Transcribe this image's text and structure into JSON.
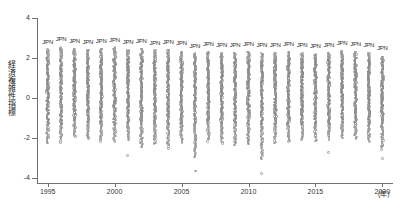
{
  "chart_data": {
    "type": "scatter",
    "title": "",
    "xlabel": "年",
    "ylabel": "経済複雑性指標",
    "xlim": [
      1994.2,
      2020.8
    ],
    "ylim": [
      -4.6,
      4.4
    ],
    "grid": false,
    "legend": null,
    "x_ticks": [
      1995,
      2000,
      2005,
      2010,
      2015,
      2020
    ],
    "x_tick_labels": [
      "1995",
      "2000",
      "2005",
      "2010",
      "2015",
      "2020"
    ],
    "y_ticks": [
      4,
      2,
      0,
      -2,
      -4
    ],
    "y_tick_labels": [
      "4",
      "2",
      "0",
      "-2",
      "-4"
    ],
    "x_unit_label": "(年)",
    "marker": "open-circle",
    "marker_color": "#9a9a9a",
    "annotation_label": "JPN",
    "series": [
      {
        "name": "経済複雑性指標 (全国)",
        "x": [
          1995,
          1996,
          1997,
          1998,
          1999,
          2000,
          2001,
          2002,
          2003,
          2004,
          2005,
          2006,
          2007,
          2008,
          2009,
          2010,
          2011,
          2012,
          2013,
          2014,
          2015,
          2016,
          2017,
          2018,
          2019,
          2020
        ],
        "jpn_values": [
          2.42,
          2.55,
          2.45,
          2.41,
          2.47,
          2.52,
          2.38,
          2.46,
          2.37,
          2.42,
          2.33,
          2.22,
          2.3,
          2.26,
          2.25,
          2.31,
          2.27,
          2.23,
          2.29,
          2.24,
          2.2,
          2.26,
          2.35,
          2.31,
          2.24,
          2.08
        ],
        "year_min": [
          -2.25,
          -2.2,
          -1.95,
          -2.05,
          -2.15,
          -2.2,
          -2.1,
          -2.45,
          -2.3,
          -2.5,
          -2.2,
          -2.95,
          -2.15,
          -2.25,
          -2.35,
          -2.3,
          -3.05,
          -2.25,
          -2.2,
          -2.1,
          -2.15,
          -2.05,
          -2.0,
          -2.05,
          -2.2,
          -2.55
        ],
        "year_max": [
          2.42,
          2.55,
          2.45,
          2.41,
          2.47,
          2.52,
          2.38,
          2.46,
          2.37,
          2.42,
          2.33,
          2.22,
          2.3,
          2.26,
          2.25,
          2.31,
          2.27,
          2.23,
          2.29,
          2.24,
          2.2,
          2.26,
          2.35,
          2.31,
          2.24,
          2.08
        ],
        "n_points_per_year": 118,
        "distribution": "countries ranked by Economic Complexity Index each year; Japan (JPN) is the top-ranked point"
      }
    ]
  },
  "axes": {
    "y_title": "経済複雑性指標",
    "x_unit": "(年)"
  }
}
